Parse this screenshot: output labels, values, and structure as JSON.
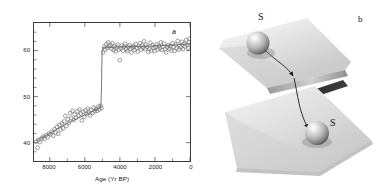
{
  "figure": {
    "panel_a_label": "a",
    "panel_b_label": "b"
  },
  "panel_a": {
    "xlabel": "Age (Yr BP)",
    "ylabel": "Terrigenous sediment (%)",
    "ytick_labels": [
      "40",
      "50",
      "60"
    ],
    "xtick_labels": [
      "8000",
      "6000",
      "4000",
      "2000",
      "0"
    ]
  },
  "panel_b": {
    "upper_state_label": "S",
    "lower_state_label": "S",
    "sheet_color": "#d9d9d9",
    "fold_edge_color": "#1c1c1c",
    "sphere_color": "#bdbdbd"
  },
  "chart_data": {
    "type": "scatter",
    "title": "",
    "xlabel": "Age (Yr BP)",
    "ylabel": "Terrigenous sediment (%)",
    "xlim": [
      8900,
      0
    ],
    "ylim": [
      66,
      36
    ],
    "x_inverted": true,
    "y_inverted": true,
    "grid": false,
    "legend": null,
    "xticks": [
      8000,
      6000,
      4000,
      2000,
      0
    ],
    "yticks": [
      40,
      50,
      60
    ],
    "series": [
      {
        "name": "Terrigenous sediment",
        "marker": "open-circle",
        "color": "#6a6a6a",
        "points": [
          [
            8780,
            40.2
          ],
          [
            8700,
            38.9
          ],
          [
            8640,
            40.6
          ],
          [
            8560,
            40.1
          ],
          [
            8470,
            40.9
          ],
          [
            8380,
            41.3
          ],
          [
            8300,
            40.8
          ],
          [
            8210,
            41.6
          ],
          [
            8120,
            41.2
          ],
          [
            8040,
            42.0
          ],
          [
            7960,
            41.8
          ],
          [
            7880,
            42.4
          ],
          [
            7800,
            41.5
          ],
          [
            7730,
            42.9
          ],
          [
            7660,
            42.2
          ],
          [
            7590,
            43.4
          ],
          [
            7520,
            41.9
          ],
          [
            7450,
            43.8
          ],
          [
            7380,
            42.8
          ],
          [
            7310,
            44.2
          ],
          [
            7240,
            43.1
          ],
          [
            7180,
            44.6
          ],
          [
            7110,
            45.8
          ],
          [
            7040,
            43.6
          ],
          [
            6970,
            45.1
          ],
          [
            6900,
            44.3
          ],
          [
            6840,
            46.4
          ],
          [
            6770,
            45.3
          ],
          [
            6700,
            46.9
          ],
          [
            6640,
            44.9
          ],
          [
            6570,
            46.1
          ],
          [
            6500,
            45.4
          ],
          [
            6430,
            46.8
          ],
          [
            6370,
            45.9
          ],
          [
            6300,
            47.2
          ],
          [
            6230,
            46.3
          ],
          [
            6170,
            44.8
          ],
          [
            6100,
            46.7
          ],
          [
            6030,
            45.6
          ],
          [
            5960,
            47.0
          ],
          [
            5900,
            46.2
          ],
          [
            5830,
            47.4
          ],
          [
            5760,
            46.5
          ],
          [
            5700,
            45.9
          ],
          [
            5630,
            47.1
          ],
          [
            5560,
            46.4
          ],
          [
            5500,
            47.6
          ],
          [
            5430,
            46.8
          ],
          [
            5360,
            47.3
          ],
          [
            5300,
            46.9
          ],
          [
            5240,
            47.8
          ],
          [
            5170,
            47.2
          ],
          [
            5110,
            48.0
          ],
          [
            5050,
            47.5
          ],
          [
            4960,
            59.6
          ],
          [
            4900,
            60.8
          ],
          [
            4840,
            60.2
          ],
          [
            4780,
            61.4
          ],
          [
            4720,
            60.6
          ],
          [
            4660,
            61.8
          ],
          [
            4600,
            60.9
          ],
          [
            4540,
            61.2
          ],
          [
            4480,
            60.4
          ],
          [
            4420,
            61.6
          ],
          [
            4360,
            60.1
          ],
          [
            4300,
            61.0
          ],
          [
            4240,
            59.8
          ],
          [
            4180,
            60.7
          ],
          [
            4120,
            61.3
          ],
          [
            4060,
            60.2
          ],
          [
            4000,
            57.9
          ],
          [
            3940,
            60.5
          ],
          [
            3880,
            61.1
          ],
          [
            3820,
            60.0
          ],
          [
            3760,
            60.9
          ],
          [
            3700,
            61.5
          ],
          [
            3640,
            60.3
          ],
          [
            3580,
            59.9
          ],
          [
            3520,
            60.8
          ],
          [
            3460,
            61.2
          ],
          [
            3400,
            60.4
          ],
          [
            3340,
            59.6
          ],
          [
            3280,
            60.7
          ],
          [
            3220,
            61.0
          ],
          [
            3160,
            60.1
          ],
          [
            3100,
            61.4
          ],
          [
            3040,
            60.5
          ],
          [
            2980,
            59.8
          ],
          [
            2920,
            60.9
          ],
          [
            2860,
            61.6
          ],
          [
            2800,
            60.2
          ],
          [
            2740,
            61.1
          ],
          [
            2680,
            60.6
          ],
          [
            2620,
            62.0
          ],
          [
            2560,
            60.3
          ],
          [
            2500,
            61.3
          ],
          [
            2440,
            60.8
          ],
          [
            2380,
            59.7
          ],
          [
            2320,
            60.4
          ],
          [
            2260,
            61.7
          ],
          [
            2200,
            60.0
          ],
          [
            2140,
            61.2
          ],
          [
            2080,
            60.6
          ],
          [
            2020,
            59.9
          ],
          [
            1960,
            60.8
          ],
          [
            1900,
            61.4
          ],
          [
            1840,
            60.2
          ],
          [
            1780,
            61.0
          ],
          [
            1720,
            60.5
          ],
          [
            1660,
            61.8
          ],
          [
            1600,
            60.1
          ],
          [
            1540,
            60.9
          ],
          [
            1480,
            61.5
          ],
          [
            1420,
            60.3
          ],
          [
            1360,
            59.6
          ],
          [
            1300,
            60.7
          ],
          [
            1240,
            61.2
          ],
          [
            1180,
            60.4
          ],
          [
            1120,
            61.0
          ],
          [
            1060,
            60.0
          ],
          [
            1000,
            61.6
          ],
          [
            940,
            60.8
          ],
          [
            880,
            59.9
          ],
          [
            820,
            61.3
          ],
          [
            760,
            60.5
          ],
          [
            700,
            62.1
          ],
          [
            640,
            60.2
          ],
          [
            580,
            61.1
          ],
          [
            520,
            60.7
          ],
          [
            460,
            61.9
          ],
          [
            400,
            60.3
          ],
          [
            340,
            61.5
          ],
          [
            280,
            60.9
          ],
          [
            220,
            62.3
          ],
          [
            160,
            61.2
          ],
          [
            100,
            60.6
          ],
          [
            60,
            61.8
          ],
          [
            20,
            62.6
          ]
        ]
      }
    ],
    "fitted_curve": {
      "name": "Regime shift fit",
      "color": "#555555",
      "points": [
        [
          8800,
          40.4
        ],
        [
          8000,
          42.0
        ],
        [
          7000,
          44.2
        ],
        [
          6000,
          46.0
        ],
        [
          5300,
          47.3
        ],
        [
          5130,
          47.6
        ],
        [
          5080,
          48.2
        ],
        [
          5050,
          52.0
        ],
        [
          5030,
          57.0
        ],
        [
          5010,
          59.9
        ],
        [
          4980,
          60.6
        ],
        [
          4900,
          60.7
        ],
        [
          4000,
          60.8
        ],
        [
          3000,
          60.9
        ],
        [
          2000,
          61.0
        ],
        [
          1000,
          61.2
        ],
        [
          0,
          61.5
        ]
      ]
    },
    "annotations": [
      {
        "text": "a",
        "x": 600,
        "y": 38.0
      }
    ]
  }
}
